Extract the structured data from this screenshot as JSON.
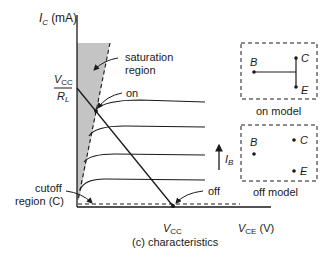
{
  "figure": {
    "caption": "(c) characteristics",
    "y_axis": {
      "symbol": "I",
      "subscript": "C",
      "unit": "(mA)"
    },
    "x_axis": {
      "symbol": "V",
      "subscript": "CE",
      "unit": "(V)"
    },
    "y_intercept": {
      "numerator": "V",
      "numerator_sub": "CC",
      "denominator": "R",
      "denominator_sub": "L"
    },
    "x_intercept": {
      "symbol": "V",
      "subscript": "CC"
    },
    "labels": {
      "saturation_line1": "saturation",
      "saturation_line2": "region",
      "on": "on",
      "off": "off",
      "cutoff_line1": "cutoff",
      "cutoff_line2": "region (C)",
      "ib_symbol": "I",
      "ib_subscript": "B"
    },
    "on_model": {
      "title": "on model",
      "B": "B",
      "C": "C",
      "E": "E"
    },
    "off_model": {
      "title": "off model",
      "B": "B",
      "C": "C",
      "E": "E"
    },
    "colors": {
      "ink": "#1a1a1a",
      "shade": "#c4c4c4"
    }
  }
}
